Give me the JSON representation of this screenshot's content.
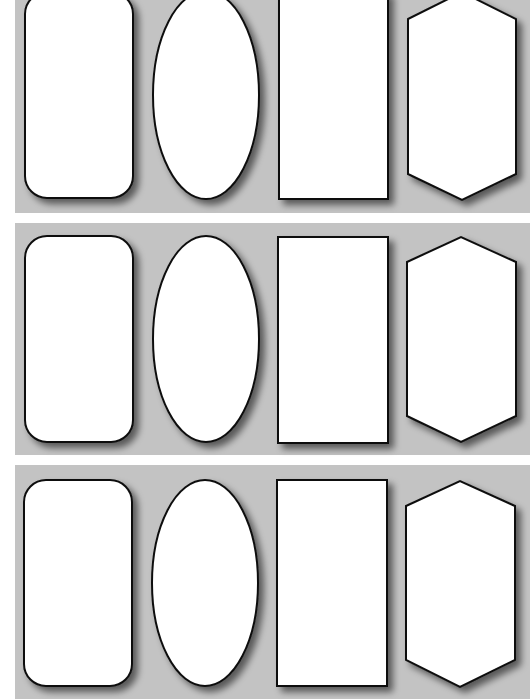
{
  "sheet": {
    "width": 530,
    "height": 699,
    "background": "#ffffff",
    "band_color": "#c3c3c3",
    "shape_fill": "#ffffff",
    "shape_stroke": "#111111",
    "bands": [
      {
        "name": "band-1",
        "top": 0,
        "height": 213,
        "shapes": [
          {
            "type": "rounded-rectangle",
            "x": 25,
            "y": -8,
            "w": 108,
            "h": 206,
            "r": 22
          },
          {
            "type": "ellipse",
            "cx": 206,
            "cy": 95,
            "rx": 53,
            "ry": 104
          },
          {
            "type": "rectangle",
            "x": 279,
            "y": -8,
            "w": 109,
            "h": 207
          },
          {
            "type": "hexagon",
            "points": "408,19 462,-8 516,19 516,174 462,200 408,174"
          }
        ]
      },
      {
        "name": "band-2",
        "top": 223,
        "height": 232,
        "shapes": [
          {
            "type": "rounded-rectangle",
            "x": 25,
            "y": 13,
            "w": 108,
            "h": 206,
            "r": 22
          },
          {
            "type": "ellipse",
            "cx": 206,
            "cy": 116,
            "rx": 53,
            "ry": 103
          },
          {
            "type": "rectangle",
            "x": 278,
            "y": 14,
            "w": 110,
            "h": 206
          },
          {
            "type": "hexagon",
            "points": "407,39 461,14 516,39 516,193 461,219 407,193"
          }
        ]
      },
      {
        "name": "band-3",
        "top": 465,
        "height": 234,
        "shapes": [
          {
            "type": "rounded-rectangle",
            "x": 24,
            "y": 15,
            "w": 108,
            "h": 206,
            "r": 22
          },
          {
            "type": "ellipse",
            "cx": 205,
            "cy": 118,
            "rx": 53,
            "ry": 103
          },
          {
            "type": "rectangle",
            "x": 277,
            "y": 15,
            "w": 110,
            "h": 206
          },
          {
            "type": "hexagon",
            "points": "406,41 460,16 515,41 515,195 460,222 406,195"
          }
        ]
      }
    ]
  }
}
